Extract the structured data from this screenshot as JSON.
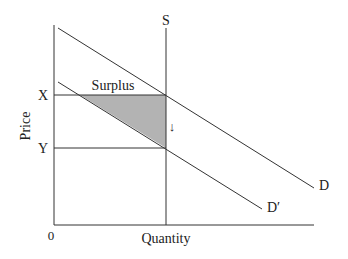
{
  "diagram": {
    "type": "supply-demand",
    "axes": {
      "x_label": "Quantity",
      "y_label": "Price",
      "origin_label": "0"
    },
    "curves": [
      {
        "name": "S",
        "label": "S",
        "kind": "vertical supply"
      },
      {
        "name": "D",
        "label": "D",
        "kind": "demand"
      },
      {
        "name": "D-prime",
        "label": "D′",
        "kind": "shifted demand"
      }
    ],
    "price_levels": [
      {
        "label": "X"
      },
      {
        "label": "Y"
      }
    ],
    "region": {
      "label": "Surplus",
      "fill": "#b3b3b3"
    },
    "shift_arrow": "↓",
    "colors": {
      "line": "#333333",
      "shade": "#b3b3b3",
      "text": "#222222"
    }
  }
}
